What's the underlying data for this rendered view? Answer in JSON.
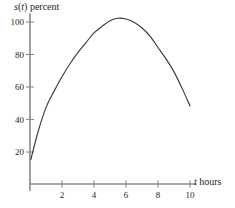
{
  "chart_data": {
    "type": "line",
    "title": "",
    "subtitle": "",
    "xlabel": "t hours",
    "xlabel_italic_part": "t",
    "xlabel_rest_part": " hours",
    "ylabel": "s(t) percent",
    "ylabel_italic_s": "s",
    "ylabel_paren_open": "(",
    "ylabel_italic_t": "t",
    "ylabel_paren_close": ")",
    "ylabel_rest_part": " percent",
    "xlim": [
      0,
      10.6
    ],
    "ylim": [
      0,
      108
    ],
    "grid": false,
    "legend": null,
    "legend_position": "none",
    "xticks": [
      2,
      4,
      6,
      8,
      10
    ],
    "xtick_labels": [
      "2",
      "4",
      "6",
      "8",
      "10"
    ],
    "yticks": [
      20,
      40,
      60,
      80,
      100
    ],
    "ytick_labels": [
      "20",
      "40",
      "60",
      "80",
      "100"
    ],
    "series": [
      {
        "name": "s(t)",
        "color": "#3b3b3b",
        "x": [
          0.05,
          0.5,
          1.0,
          1.5,
          2.0,
          2.5,
          3.0,
          3.5,
          4.0,
          4.5,
          5.0,
          5.5,
          6.0,
          6.5,
          7.0,
          7.5,
          8.0,
          8.5,
          9.0,
          9.5,
          10.0
        ],
        "y": [
          15,
          32,
          47,
          57,
          66,
          74,
          81,
          87,
          93,
          97,
          100.5,
          102,
          101.5,
          99.5,
          96,
          91,
          84,
          77,
          69,
          59,
          48
        ]
      }
    ],
    "annotations": [],
    "axis_color": "#8a8a8a",
    "background_color": "#ffffff",
    "curve_color": "#3b3b3b",
    "peak": {
      "x": 5.5,
      "y": 102
    },
    "start_point": {
      "x": 0.05,
      "y": 15
    },
    "end_point": {
      "x": 10.0,
      "y": 48
    }
  },
  "geometry": {
    "origin_x_px": 30,
    "origin_y_px": 184,
    "x_unit_px": 16,
    "y_unit_px": 1.625,
    "axis_x_end_px": 196,
    "axis_y_top_px": 14
  }
}
